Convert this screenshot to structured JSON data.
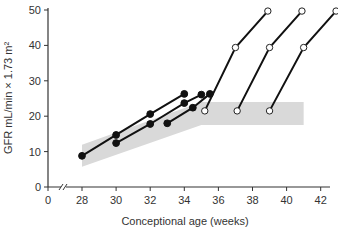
{
  "chart_data": {
    "type": "line",
    "title": "",
    "xlabel": "Conceptional age (weeks)",
    "ylabel": "GFR mL/min × 1.73 m²",
    "xlim": [
      0,
      43
    ],
    "ylim": [
      0,
      50
    ],
    "axis_break": "x between 0 and 28",
    "x_ticks": [
      0,
      28,
      30,
      32,
      34,
      36,
      38,
      40,
      42
    ],
    "y_ticks": [
      0,
      10,
      20,
      30,
      40,
      50
    ],
    "grid": false,
    "legend": null,
    "shaded_band": {
      "description": "Normal range band",
      "upper": [
        [
          28,
          11.9
        ],
        [
          35,
          24
        ],
        [
          41,
          24
        ]
      ],
      "lower": [
        [
          28,
          5.7
        ],
        [
          35,
          17.5
        ],
        [
          41,
          17.5
        ]
      ],
      "color": "#d9d9d9"
    },
    "series": [
      {
        "name": "Preterm infant A",
        "marker": "filled",
        "points": [
          [
            28,
            8.8
          ],
          [
            30,
            14.7
          ],
          [
            32,
            20.6
          ],
          [
            34,
            26.3
          ]
        ]
      },
      {
        "name": "Preterm infant B",
        "marker": "filled",
        "points": [
          [
            30,
            12.4
          ],
          [
            32,
            17.8
          ],
          [
            34,
            23.7
          ],
          [
            35,
            26.1
          ]
        ]
      },
      {
        "name": "Preterm infant C",
        "marker": "filled",
        "points": [
          [
            33,
            18.0
          ],
          [
            34.5,
            22.4
          ],
          [
            35.5,
            26.3
          ]
        ]
      },
      {
        "name": "Term infant 1",
        "marker": "open",
        "points": [
          [
            35.2,
            21.5
          ],
          [
            37,
            39.4
          ],
          [
            38.9,
            49.7
          ]
        ]
      },
      {
        "name": "Term infant 2",
        "marker": "open",
        "points": [
          [
            37.1,
            21.5
          ],
          [
            39,
            39.4
          ],
          [
            40.9,
            49.7
          ]
        ]
      },
      {
        "name": "Term infant 3",
        "marker": "open",
        "points": [
          [
            39,
            21.5
          ],
          [
            41,
            39.4
          ],
          [
            42.9,
            49.7
          ]
        ]
      }
    ]
  }
}
